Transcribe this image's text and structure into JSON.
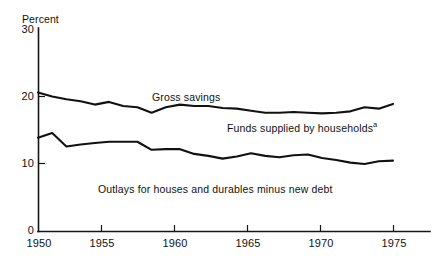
{
  "chart_data": {
    "type": "line",
    "title": "",
    "subtitle": "",
    "xlabel": "",
    "ylabel": "Percent",
    "ylim": [
      0,
      30
    ],
    "xlim": [
      1950,
      1976
    ],
    "grid": false,
    "legend_position": "inline-annotation",
    "y_ticks": [
      "0",
      "10",
      "20",
      "30"
    ],
    "y_tick_values": [
      0,
      10,
      20,
      30
    ],
    "x_ticks": [
      "1950",
      "1955",
      "1960",
      "1965",
      "1970",
      "1975"
    ],
    "x_tick_values": [
      1950,
      1955,
      1960,
      1965,
      1970,
      1975
    ],
    "x": [
      1950,
      1951,
      1952,
      1953,
      1954,
      1955,
      1956,
      1957,
      1958,
      1959,
      1960,
      1961,
      1962,
      1963,
      1964,
      1965,
      1966,
      1967,
      1968,
      1969,
      1970,
      1971,
      1972,
      1973,
      1974,
      1975
    ],
    "series": [
      {
        "name": "Gross savings",
        "color": "#111111",
        "values": [
          20.6,
          20.0,
          19.6,
          19.3,
          18.8,
          19.2,
          18.6,
          18.4,
          17.6,
          18.4,
          18.8,
          18.6,
          18.6,
          18.3,
          18.2,
          17.9,
          17.6,
          17.6,
          17.7,
          17.6,
          17.5,
          17.6,
          17.8,
          18.4,
          18.2,
          18.9
        ]
      },
      {
        "name": "Funds supplied by households",
        "color": "#111111",
        "values": [
          13.9,
          14.6,
          12.6,
          12.9,
          13.1,
          13.3,
          13.3,
          13.3,
          12.1,
          12.2,
          12.2,
          11.5,
          11.2,
          10.8,
          11.1,
          11.6,
          11.2,
          11.0,
          11.3,
          11.4,
          10.9,
          10.6,
          10.2,
          10.0,
          10.4,
          10.5
        ]
      }
    ],
    "annotations": [
      {
        "text": "Gross savings",
        "x_px": 152,
        "y_px": 92
      },
      {
        "text": "Funds supplied by households",
        "superscript": "a",
        "x_px": 227,
        "y_px": 121
      },
      {
        "text": "Outlays for houses and durables minus new debt",
        "x_px": 98,
        "y_px": 184
      }
    ]
  },
  "axis": {
    "y_label": "Percent",
    "y_ticks": [
      {
        "label": "30"
      },
      {
        "label": "20"
      },
      {
        "label": "10"
      },
      {
        "label": "0"
      }
    ],
    "x_ticks": [
      {
        "label": "1950"
      },
      {
        "label": "1955"
      },
      {
        "label": "1960"
      },
      {
        "label": "1965"
      },
      {
        "label": "1970"
      },
      {
        "label": "1975"
      }
    ]
  },
  "annotations": {
    "gross_savings": "Gross savings",
    "funds_supplied": "Funds supplied by households",
    "funds_supplied_superscript": "a",
    "outlays": "Outlays for houses and durables minus new debt"
  },
  "colors": {
    "line": "#111111",
    "axis": "#161616",
    "background": "#ffffff"
  }
}
